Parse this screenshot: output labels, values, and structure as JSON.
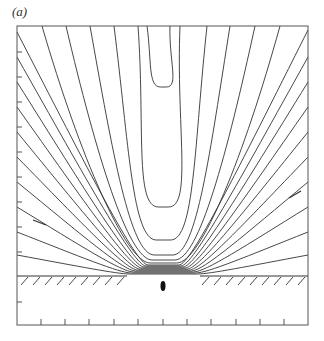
{
  "figure": {
    "panel_label": "(a)",
    "frame": {
      "x0": 17,
      "y0": 26,
      "x1": 308,
      "y1": 325
    },
    "wall": {
      "y": 276,
      "gap_left": 127,
      "gap_right": 200,
      "hatch_spacing": 12
    },
    "object": {
      "cx": 163,
      "cy": 286,
      "rx": 2.5,
      "ry": 5
    },
    "bottom_ticks_x": [
      41,
      65,
      89,
      114,
      138,
      163,
      187,
      211,
      236,
      260,
      284
    ],
    "left_ticks_y": [
      52,
      77,
      102,
      127,
      152,
      177,
      202,
      227,
      252,
      302
    ],
    "arrows": [
      {
        "x1": 33,
        "y1": 220,
        "x2": 46,
        "y2": 225
      },
      {
        "x1": 289,
        "y1": 198,
        "x2": 301,
        "y2": 191
      }
    ],
    "colors": {
      "line": "#333333",
      "frame": "#555555"
    }
  },
  "chart_data": {
    "type": "contour",
    "title": "(a)",
    "open_curves": [
      {
        "top_left_x": 17,
        "top_right_x": 305,
        "side_y_left": 255,
        "side_y_right": 255,
        "bottom_y": 274
      },
      {
        "top_left_x": 17,
        "top_right_x": 308,
        "side_y_left": 232,
        "side_y_right": 232,
        "bottom_y": 273
      },
      {
        "top_left_x": 17,
        "top_right_x": 308,
        "side_y_left": 207,
        "side_y_right": 207,
        "bottom_y": 272
      },
      {
        "top_left_x": 17,
        "top_right_x": 308,
        "side_y_left": 182,
        "side_y_right": 182,
        "bottom_y": 271
      },
      {
        "top_left_x": 17,
        "top_right_x": 308,
        "side_y_left": 157,
        "side_y_right": 157,
        "bottom_y": 270
      },
      {
        "top_left_x": 17,
        "top_right_x": 308,
        "side_y_left": 132,
        "side_y_right": 132,
        "bottom_y": 269
      },
      {
        "top_left_x": 17,
        "top_right_x": 308,
        "side_y_left": 107,
        "side_y_right": 107,
        "bottom_y": 268
      },
      {
        "top_left_x": 17,
        "top_right_x": 308,
        "side_y_left": 82,
        "side_y_right": 82,
        "bottom_y": 267
      },
      {
        "top_left_x": 17,
        "top_right_x": 308,
        "side_y_left": 57,
        "side_y_right": 57,
        "bottom_y": 266
      },
      {
        "top_left_x": 17,
        "top_right_x": 305,
        "side_y_left": 32,
        "side_y_right": 30,
        "bottom_y": 265
      },
      {
        "top_left_x": 42,
        "top_right_x": 280,
        "side_y_left": 26,
        "side_y_right": 26,
        "bottom_y": 263
      },
      {
        "top_left_x": 66,
        "top_right_x": 255,
        "side_y_left": 26,
        "side_y_right": 26,
        "bottom_y": 260
      },
      {
        "top_left_x": 90,
        "top_right_x": 230,
        "side_y_left": 26,
        "side_y_right": 26,
        "bottom_y": 255
      },
      {
        "top_left_x": 114,
        "top_right_x": 207,
        "side_y_left": 26,
        "side_y_right": 26,
        "bottom_y": 240
      },
      {
        "top_left_x": 138,
        "top_right_x": 180,
        "side_y_left": 26,
        "side_y_right": 26,
        "bottom_y": 207
      },
      {
        "top_left_x": 147,
        "top_right_x": 170,
        "side_y_left": 26,
        "side_y_right": 26,
        "bottom_y": 87
      }
    ],
    "xlim": [
      17,
      308
    ],
    "ylim": [
      26,
      325
    ],
    "grid": false
  }
}
